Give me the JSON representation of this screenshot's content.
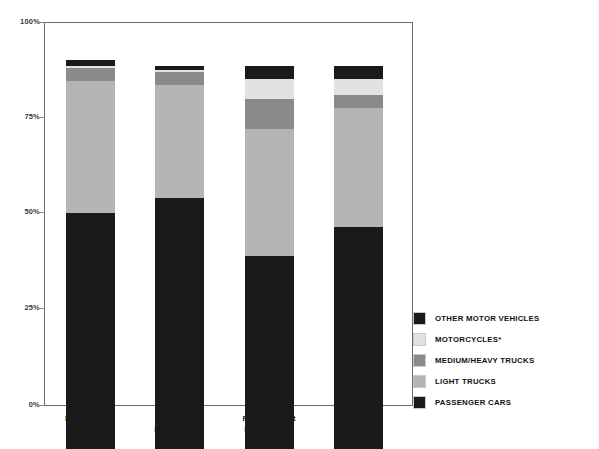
{
  "chart_data": {
    "type": "bar",
    "subtype": "stacked-percent",
    "title": "",
    "xlabel": "",
    "ylabel": "",
    "ylim": [
      0,
      100
    ],
    "grid": true,
    "legend_position": "right-bottom",
    "ytick_labels": [
      "100%",
      "75%",
      "50%",
      "25%",
      "0%"
    ],
    "ytick_values": [
      100,
      75,
      50,
      25,
      0
    ],
    "categories": [
      "Registrations",
      "All Accident Involvements",
      "Fatal Accident Involvements",
      "Occupant Fatalities"
    ],
    "category_lines": [
      [
        "Registrations"
      ],
      [
        "All Accident",
        "Involvements"
      ],
      [
        "Fatal Accident",
        "Involvements"
      ],
      [
        "Occupant",
        "Fatalities"
      ]
    ],
    "series": [
      {
        "name": "PASSENGER CARS",
        "color": "#1a1a1a",
        "values": [
          61.5,
          65.5,
          50.5,
          58.0
        ]
      },
      {
        "name": "LIGHT TRUCKS",
        "color": "#b5b5b5",
        "values": [
          34.5,
          29.5,
          33.0,
          31.0
        ]
      },
      {
        "name": "MEDIUM/HEAVY TRUCKS",
        "color": "#8a8a8a",
        "values": [
          3.5,
          3.5,
          8.0,
          3.5
        ]
      },
      {
        "name": "MOTORCYCLES*",
        "color": "#e2e2e2",
        "values": [
          0.5,
          0.5,
          5.0,
          4.0
        ]
      },
      {
        "name": "OTHER MOTOR VEHICLES",
        "color": "#1a1a1a",
        "values": [
          1.5,
          1.0,
          3.5,
          3.5
        ]
      }
    ],
    "legend_order_top_to_bottom": [
      "OTHER MOTOR VEHICLES",
      "MOTORCYCLES*",
      "MEDIUM/HEAVY TRUCKS",
      "LIGHT TRUCKS",
      "PASSENGER CARS"
    ]
  },
  "legend": {
    "items": [
      {
        "label": "OTHER MOTOR VEHICLES",
        "color": "#1a1a1a"
      },
      {
        "label": "MOTORCYCLES*",
        "color": "#e2e2e2"
      },
      {
        "label": "MEDIUM/HEAVY TRUCKS",
        "color": "#8a8a8a"
      },
      {
        "label": "LIGHT TRUCKS",
        "color": "#b5b5b5"
      },
      {
        "label": "PASSENGER CARS",
        "color": "#1a1a1a"
      }
    ]
  },
  "axis": {
    "y_labels": [
      "100%",
      "75%",
      "50%",
      "25%",
      "0%"
    ]
  }
}
